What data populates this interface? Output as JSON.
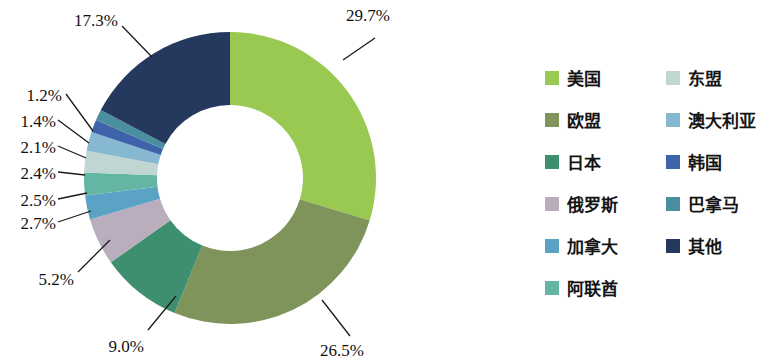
{
  "chart_data": {
    "type": "pie",
    "variant": "donut",
    "title": "",
    "subtitle": "",
    "xlabel": "",
    "ylabel": "",
    "units": "%",
    "start_angle_deg": 0,
    "direction": "clockwise",
    "inner_radius_ratio": 0.5,
    "legend_position": "right",
    "grid": false,
    "categories": [
      "美国",
      "欧盟",
      "日本",
      "俄罗斯",
      "加拿大",
      "阿联酋",
      "东盟",
      "澳大利亚",
      "韩国",
      "巴拿马",
      "其他"
    ],
    "values": [
      29.7,
      26.5,
      9.0,
      5.2,
      2.7,
      2.5,
      2.4,
      2.1,
      1.4,
      1.2,
      17.3
    ],
    "value_labels": [
      "29.7%",
      "26.5%",
      "9.0%",
      "5.2%",
      "2.7%",
      "2.5%",
      "2.4%",
      "2.1%",
      "1.4%",
      "1.2%",
      "17.3%"
    ],
    "colors": [
      "#9ac951",
      "#7f945a",
      "#3e8f70",
      "#b9adbe",
      "#5ba3c4",
      "#63b5a4",
      "#c0d6d2",
      "#86b8d2",
      "#3f63ab",
      "#4a8fa0",
      "#25395f"
    ],
    "slices": [
      {
        "label": "美国",
        "value": 29.7,
        "value_label": "29.7%",
        "color": "#9ac951"
      },
      {
        "label": "欧盟",
        "value": 26.5,
        "value_label": "26.5%",
        "color": "#7f945a"
      },
      {
        "label": "日本",
        "value": 9.0,
        "value_label": "9.0%",
        "color": "#3e8f70"
      },
      {
        "label": "俄罗斯",
        "value": 5.2,
        "value_label": "5.2%",
        "color": "#b9adbe"
      },
      {
        "label": "加拿大",
        "value": 2.7,
        "value_label": "2.7%",
        "color": "#5ba3c4"
      },
      {
        "label": "阿联酋",
        "value": 2.5,
        "value_label": "2.5%",
        "color": "#63b5a4"
      },
      {
        "label": "东盟",
        "value": 2.4,
        "value_label": "2.4%",
        "color": "#c0d6d2"
      },
      {
        "label": "澳大利亚",
        "value": 2.1,
        "value_label": "2.1%",
        "color": "#86b8d2"
      },
      {
        "label": "韩国",
        "value": 1.4,
        "value_label": "1.4%",
        "color": "#3f63ab"
      },
      {
        "label": "巴拿马",
        "value": 1.2,
        "value_label": "1.2%",
        "color": "#4a8fa0"
      },
      {
        "label": "其他",
        "value": 17.3,
        "value_label": "17.3%",
        "color": "#25395f"
      }
    ]
  },
  "labels": {
    "p1": "29.7%",
    "p2": "26.5%",
    "p3": "9.0%",
    "p4": "5.2%",
    "p5": "2.7%",
    "p6": "2.5%",
    "p7": "2.4%",
    "p8": "2.1%",
    "p9": "1.4%",
    "p10": "1.2%",
    "p11": "17.3%"
  },
  "legend": {
    "column_left": [
      {
        "label": "美国",
        "color": "#9ac951"
      },
      {
        "label": "欧盟",
        "color": "#7f945a"
      },
      {
        "label": "日本",
        "color": "#3e8f70"
      },
      {
        "label": "俄罗斯",
        "color": "#b9adbe"
      },
      {
        "label": "加拿大",
        "color": "#5ba3c4"
      },
      {
        "label": "阿联酋",
        "color": "#63b5a4"
      }
    ],
    "column_right": [
      {
        "label": "东盟",
        "color": "#c0d6d2"
      },
      {
        "label": "澳大利亚",
        "color": "#86b8d2"
      },
      {
        "label": "韩国",
        "color": "#3f63ab"
      },
      {
        "label": "巴拿马",
        "color": "#4a8fa0"
      },
      {
        "label": "其他",
        "color": "#25395f"
      }
    ]
  }
}
